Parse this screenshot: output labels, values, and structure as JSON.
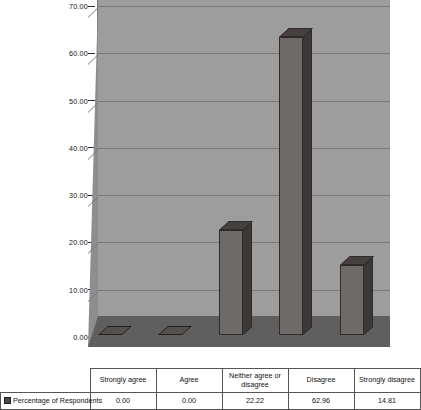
{
  "chart_data": {
    "type": "bar",
    "title": "",
    "subtitle": "",
    "xlabel": "",
    "ylabel": "",
    "categories": [
      "Strongly agree",
      "Agree",
      "Neither agree or disagree",
      "Disagree",
      "Strongly disagree"
    ],
    "series": [
      {
        "name": "Percentage of Respondents",
        "values": [
          0.0,
          0.0,
          22.22,
          62.96,
          14.81
        ],
        "value_labels": [
          "0.00",
          "0.00",
          "22.22",
          "62.96",
          "14.81"
        ],
        "color": "#6d6a68"
      }
    ],
    "ylim": [
      0,
      70
    ],
    "ytick_step": 10,
    "ytick_labels": [
      "70.00",
      "60.00",
      "50.00",
      "40.00",
      "30.00",
      "20.00",
      "10.00",
      "0.00"
    ],
    "ytick_values": [
      70,
      60,
      50,
      40,
      30,
      20,
      10,
      0
    ],
    "grid": true,
    "legend_position": "bottom-table",
    "style": "3d-column",
    "colors": {
      "bar_front": "#6d6a68",
      "bar_side": "#3c3836",
      "bar_top": "#46413f",
      "wall": "#9d9d9d",
      "side_wall": "#8e8e8e",
      "floor": "#5f5f5f",
      "gridline": "#7a7a7a",
      "text": "#111111"
    }
  },
  "table": {
    "series_label": "Percentage of Respondents",
    "header": [
      "Strongly agree",
      "Agree",
      "Neither agree or disagree",
      "Disagree",
      "Strongly disagree"
    ],
    "values": [
      "0.00",
      "0.00",
      "22.22",
      "62.96",
      "14.81"
    ]
  },
  "icons": {
    "legend_swatch": "legend-swatch-icon"
  }
}
